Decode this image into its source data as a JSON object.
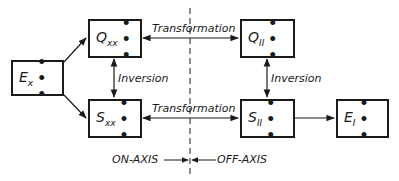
{
  "diagram": {
    "nodes": {
      "ex": {
        "symbol": "E",
        "subscript": "x",
        "dots": "• • •"
      },
      "qxx": {
        "symbol": "Q",
        "subscript": "xx",
        "dots": "• • •"
      },
      "sxx": {
        "symbol": "S",
        "subscript": "xx",
        "dots": "• • •"
      },
      "qii": {
        "symbol": "Q",
        "subscript": "II",
        "dots": "• • •"
      },
      "sii": {
        "symbol": "S",
        "subscript": "II",
        "dots": "• • •"
      },
      "ei": {
        "symbol": "E",
        "subscript": "I",
        "dots": "• • •"
      }
    },
    "edges": {
      "transformation_top": "Transformation",
      "transformation_bottom": "Transformation",
      "inversion_left": "Inversion",
      "inversion_right": "Inversion"
    },
    "regions": {
      "on_axis": "ON-AXIS",
      "off_axis": "OFF-AXIS"
    },
    "line_color": "#1a1a1a"
  }
}
